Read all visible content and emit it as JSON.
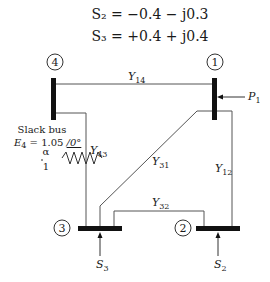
{
  "equations": {
    "s2": "S₂ = −0.4 − j0.3",
    "s3": "S₃ = +0.4 + j0.4"
  },
  "buses": [
    {
      "id": "bus-1",
      "number": "1"
    },
    {
      "id": "bus-2",
      "number": "2"
    },
    {
      "id": "bus-3",
      "number": "3"
    },
    {
      "id": "bus-4",
      "number": "4"
    }
  ],
  "lines": {
    "y14": {
      "main": "Y",
      "sub": "14"
    },
    "y43": {
      "main": "Y",
      "sub": "43"
    },
    "y31": {
      "main": "Y",
      "sub": "31"
    },
    "y12": {
      "main": "Y",
      "sub": "12"
    },
    "y32": {
      "main": "Y",
      "sub": "32"
    }
  },
  "injections": {
    "p1": {
      "main": "P",
      "sub": "1"
    },
    "s2": {
      "main": "S",
      "sub": "2"
    },
    "s3": {
      "main": "S",
      "sub": "3"
    }
  },
  "slack": {
    "title": "Slack bus",
    "voltage_label": "E",
    "voltage_sub": "4",
    "voltage_value": " = 1.05 ",
    "angle": "/0°"
  },
  "transformer": {
    "alpha": "α",
    "ratio": "1"
  },
  "colors": {
    "line": "#555555",
    "bus": "#111111",
    "text": "#1a1a1a"
  }
}
